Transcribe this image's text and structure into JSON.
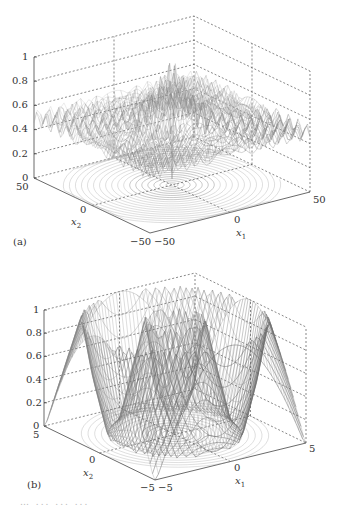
{
  "chart_data": [
    {
      "type": "surface3d",
      "panel_label": "(a)",
      "title": "",
      "function_shape": "Schaffer-like: oscillating ripples around 0.5 with central peak near 1 and center dip near 0",
      "xlabel": "x1",
      "ylabel": "x2",
      "zlabel": "",
      "x_ticks": [
        "-50",
        "0",
        "50"
      ],
      "y_ticks": [
        "-50",
        "0",
        "50"
      ],
      "z_ticks": [
        "0",
        "0.2",
        "0.4",
        "0.6",
        "0.8",
        "1"
      ],
      "xlim": [
        -50,
        50
      ],
      "ylim": [
        -50,
        50
      ],
      "zlim": [
        0,
        1
      ],
      "contour_on_base": true,
      "grid": true,
      "samples": {
        "r": [
          0,
          2,
          5,
          10,
          20,
          30,
          40,
          50,
          70
        ],
        "z_approx": [
          0.0,
          0.95,
          0.8,
          0.65,
          0.55,
          0.52,
          0.5,
          0.5,
          0.5
        ]
      }
    },
    {
      "type": "surface3d",
      "panel_label": "(b)",
      "title": "",
      "function_shape": "radial ring: high ring (~1) at r≈2 and r≈5 corners, low trough at center and r≈3.5",
      "xlabel": "x1",
      "ylabel": "x2",
      "zlabel": "",
      "x_ticks": [
        "-5",
        "0",
        "5"
      ],
      "y_ticks": [
        "-5",
        "0",
        "5"
      ],
      "z_ticks": [
        "0",
        "0.2",
        "0.4",
        "0.6",
        "0.8",
        "1"
      ],
      "xlim": [
        -5,
        5
      ],
      "ylim": [
        -5,
        5
      ],
      "zlim": [
        0,
        1
      ],
      "contour_on_base": true,
      "grid": true,
      "samples": {
        "r": [
          0,
          1,
          1.6,
          2.2,
          3,
          3.6,
          4.4,
          5,
          6,
          7
        ],
        "z_approx": [
          0.0,
          0.4,
          1.0,
          0.6,
          0.1,
          0.0,
          0.5,
          1.0,
          0.5,
          0.0
        ]
      }
    }
  ],
  "panels": {
    "a": {
      "label": "(a)",
      "x_axis_label": "x",
      "x_axis_sub": "1",
      "y_axis_label": "x",
      "y_axis_sub": "2",
      "z_ticks": [
        "1",
        "0.8",
        "0.6",
        "0.4",
        "0.2",
        "0"
      ],
      "y_tick_back": "50",
      "y_tick_mid": "0",
      "y_tick_front": "−50",
      "x_tick_front": "−50",
      "x_tick_mid": "0",
      "x_tick_right": "50"
    },
    "b": {
      "label": "(b)",
      "x_axis_label": "x",
      "x_axis_sub": "1",
      "y_axis_label": "x",
      "y_axis_sub": "2",
      "z_ticks": [
        "1",
        "0.8",
        "0.6",
        "0.4",
        "0.2",
        "0"
      ],
      "y_tick_back": "5",
      "y_tick_mid": "0",
      "y_tick_front": "−5",
      "x_tick_front": "−5",
      "x_tick_mid": "0",
      "x_tick_right": "5"
    }
  },
  "caption_fragment": "… ... ... ..."
}
